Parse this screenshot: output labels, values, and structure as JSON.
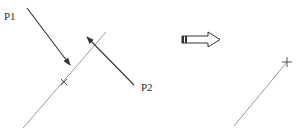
{
  "diagram": {
    "labels": {
      "p1": "P1",
      "p2": "P2"
    },
    "colors": {
      "line": "#9a9a9a",
      "arrow": "#333333",
      "text": "#333333",
      "block_arrow_stroke": "#333333",
      "background": "#ffffff"
    },
    "before": {
      "line": {
        "x1": 23,
        "y1": 128,
        "x2": 106,
        "y2": 32
      },
      "point_marker": {
        "x": 64,
        "y": 82
      },
      "arrow_p1": {
        "x1": 27,
        "y1": 8,
        "x2": 70,
        "y2": 65
      },
      "arrow_p2": {
        "x1": 134,
        "y1": 85,
        "x2": 87,
        "y2": 37
      }
    },
    "transition_arrow": {
      "x": 182,
      "y": 36,
      "length": 38
    },
    "after": {
      "line": {
        "x1": 234,
        "y1": 126,
        "x2": 287,
        "y2": 62
      },
      "point_marker": {
        "x": 287,
        "y": 62
      }
    }
  }
}
